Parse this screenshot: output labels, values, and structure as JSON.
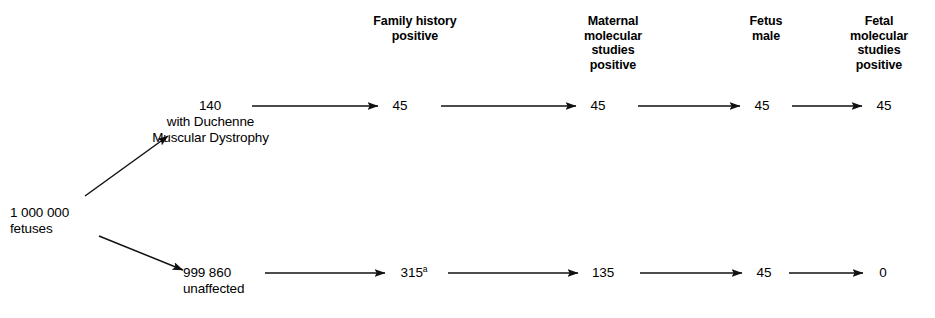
{
  "diagram": {
    "type": "flow-tree",
    "title": "",
    "columns": [
      {
        "id": "family-history-positive",
        "label": "Family history\npositive",
        "x": 415,
        "y": 14
      },
      {
        "id": "maternal-molecular-studies-positive",
        "label": "Maternal\nmolecular\nstudies\npositive",
        "x": 613,
        "y": 14
      },
      {
        "id": "fetus-male",
        "label": "Fetus\nmale",
        "x": 766,
        "y": 14
      },
      {
        "id": "fetal-molecular-studies-positive",
        "label": "Fetal\nmolecular\nstudies\npositive",
        "x": 879,
        "y": 14
      }
    ],
    "root": {
      "id": "root-fetuses",
      "value": "1 000 000",
      "label": "fetuses",
      "x": 50,
      "y": 205
    },
    "branches": [
      {
        "id": "affected-branch",
        "node": {
          "id": "duchenne-node",
          "value": "140",
          "label": "with Duchenne\nMuscular Dystrophy",
          "x": 180,
          "y": 104
        },
        "steps": [
          {
            "id": "affected-family-history",
            "column": "family-history-positive",
            "value": "45",
            "superscript": ""
          },
          {
            "id": "affected-maternal-molecular",
            "column": "maternal-molecular-studies-positive",
            "value": "45",
            "superscript": ""
          },
          {
            "id": "affected-fetus-male",
            "column": "fetus-male",
            "value": "45",
            "superscript": ""
          },
          {
            "id": "affected-fetal-molecular",
            "column": "fetal-molecular-studies-positive",
            "value": "45",
            "superscript": ""
          }
        ]
      },
      {
        "id": "unaffected-branch",
        "node": {
          "id": "unaffected-node",
          "value": "999 860",
          "label": "unaffected",
          "x": 185,
          "y": 265
        },
        "steps": [
          {
            "id": "unaffected-family-history",
            "column": "family-history-positive",
            "value": "315",
            "superscript": "a"
          },
          {
            "id": "unaffected-maternal-molecular",
            "column": "maternal-molecular-studies-positive",
            "value": "135",
            "superscript": ""
          },
          {
            "id": "unaffected-fetus-male",
            "column": "fetus-male",
            "value": "45",
            "superscript": ""
          },
          {
            "id": "unaffected-fetal-molecular",
            "column": "fetal-molecular-studies-positive",
            "value": "0",
            "superscript": ""
          }
        ]
      }
    ],
    "colors": {
      "background": "#ffffff",
      "text": "#000000",
      "stroke": "#1a1a1a"
    }
  }
}
